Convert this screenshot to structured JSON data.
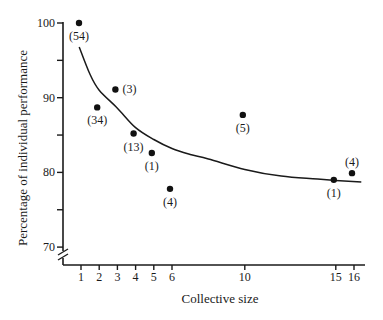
{
  "chart_data": {
    "type": "scatter",
    "title": "",
    "xlabel": "Collective size",
    "ylabel": "Percentage of individual performance",
    "xlim": [
      0,
      17
    ],
    "ylim": [
      70,
      100
    ],
    "grid": false,
    "legend": null,
    "x_ticks": [
      1,
      2,
      3,
      4,
      5,
      6,
      10,
      15,
      16
    ],
    "x_tick_labels": [
      "1",
      "2",
      "3",
      "4",
      "5",
      "6",
      "10",
      "15",
      "16"
    ],
    "y_ticks_major": [
      100,
      90,
      80,
      70
    ],
    "y_tick_labels": [
      "100",
      "90",
      "80",
      "70"
    ],
    "y_ticks_minor": [
      95,
      85,
      75
    ],
    "y_axis_break": true,
    "points": [
      {
        "x": 1,
        "y": 100.0,
        "label": "(54)",
        "label_pos": "below"
      },
      {
        "x": 2,
        "y": 88.7,
        "label": "(34)",
        "label_pos": "below"
      },
      {
        "x": 3,
        "y": 91.1,
        "label": "(3)",
        "label_pos": "right"
      },
      {
        "x": 4,
        "y": 85.2,
        "label": "(13)",
        "label_pos": "below"
      },
      {
        "x": 5,
        "y": 82.6,
        "label": "(1)",
        "label_pos": "below"
      },
      {
        "x": 6,
        "y": 77.8,
        "label": "(4)",
        "label_pos": "below"
      },
      {
        "x": 10,
        "y": 87.7,
        "label": "(5)",
        "label_pos": "below"
      },
      {
        "x": 15,
        "y": 79.0,
        "label": "(1)",
        "label_pos": "below"
      },
      {
        "x": 16,
        "y": 79.9,
        "label": "(4)",
        "label_pos": "above"
      }
    ],
    "fit_curve": [
      [
        0.9,
        96.8
      ],
      [
        1.5,
        93.1
      ],
      [
        2,
        91.0
      ],
      [
        3,
        88.6
      ],
      [
        4,
        86.0
      ],
      [
        5,
        84.4
      ],
      [
        6,
        83.2
      ],
      [
        7,
        82.4
      ],
      [
        8,
        81.8
      ],
      [
        10,
        80.4
      ],
      [
        12,
        79.5
      ],
      [
        14,
        79.1
      ],
      [
        16.4,
        78.7
      ]
    ]
  }
}
